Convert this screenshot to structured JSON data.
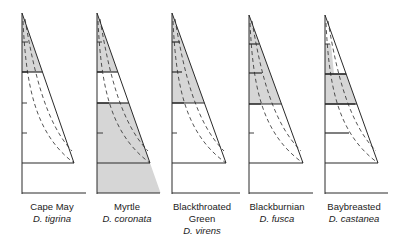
{
  "figure": {
    "type": "warbler foraging zones in spruce trees",
    "colors": {
      "line": "#2a2a2a",
      "shade": "#d6d6d6",
      "background": "#ffffff"
    }
  },
  "trees": [
    {
      "common": "Cape May",
      "latin": "D. tigrina",
      "x0": 22,
      "apex_y": 13,
      "base_y": 163,
      "ground_y": 193,
      "trunk_right": 74,
      "ground_right": 86,
      "ticks": [
        42,
        72,
        103,
        133
      ],
      "tick_len": [
        6,
        6,
        5,
        5
      ],
      "shade": {
        "from": 13,
        "to": 72
      },
      "bold_lines": [
        72,
        163
      ],
      "ground_shaded": false
    },
    {
      "common": "Myrtle",
      "latin": "D. coronata",
      "x0": 97,
      "apex_y": 13,
      "base_y": 163,
      "ground_y": 193,
      "trunk_right": 150,
      "ground_right": 160,
      "ticks": [
        42,
        72,
        103,
        133
      ],
      "tick_len": [
        5,
        5,
        12,
        6
      ],
      "shade_segments": [
        {
          "from": 13,
          "to": 72
        },
        {
          "from": 103,
          "to": 193
        }
      ],
      "bold_lines": [
        72,
        103,
        163
      ],
      "ground_shaded": true
    },
    {
      "common": "Blackthroated Green",
      "common_lines": [
        "Blackthroated",
        "Green"
      ],
      "latin": "D. virens",
      "x0": 172,
      "apex_y": 13,
      "base_y": 163,
      "ground_y": 193,
      "trunk_right": 226,
      "ground_right": 240,
      "ticks": [
        42,
        72,
        103,
        133
      ],
      "tick_len": [
        8,
        10,
        12,
        5
      ],
      "shade": {
        "from": 13,
        "to": 103
      },
      "bold_lines": [
        42,
        72,
        103,
        163
      ],
      "ground_shaded": false
    },
    {
      "common": "Blackburnian",
      "latin": "D. fusca",
      "x0": 249,
      "apex_y": 15,
      "base_y": 163,
      "ground_y": 193,
      "trunk_right": 303,
      "ground_right": 313,
      "ticks": [
        44,
        73,
        104,
        133
      ],
      "tick_len": [
        10,
        13,
        12,
        5
      ],
      "shade": {
        "from": 15,
        "to": 104
      },
      "bold_lines": [
        44,
        73,
        104,
        163
      ],
      "ground_shaded": false
    },
    {
      "common": "Baybreasted",
      "latin": "D. castanea",
      "x0": 325,
      "apex_y": 15,
      "base_y": 163,
      "ground_y": 193,
      "trunk_right": 378,
      "ground_right": 388,
      "ticks": [
        44,
        74,
        104,
        133
      ],
      "tick_len": [
        5,
        30,
        30,
        24
      ],
      "shade_segments": [
        {
          "from": 44,
          "to": 74,
          "narrow": true
        },
        {
          "from": 74,
          "to": 104
        }
      ],
      "bold_lines": [
        74,
        104,
        133,
        163
      ],
      "ground_shaded": false
    }
  ]
}
